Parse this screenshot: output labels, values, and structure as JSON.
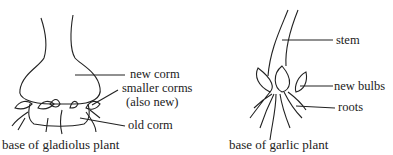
{
  "gladiolus": {
    "caption": "base of gladiolus plant",
    "labels": {
      "new_corm": "new corm",
      "smaller_corms": "smaller corms",
      "also_new": "(also new)",
      "old_corm": "old corm"
    }
  },
  "garlic": {
    "caption": "base of garlic plant",
    "labels": {
      "stem": "stem",
      "new_bulbs": "new bulbs",
      "roots": "roots"
    }
  }
}
